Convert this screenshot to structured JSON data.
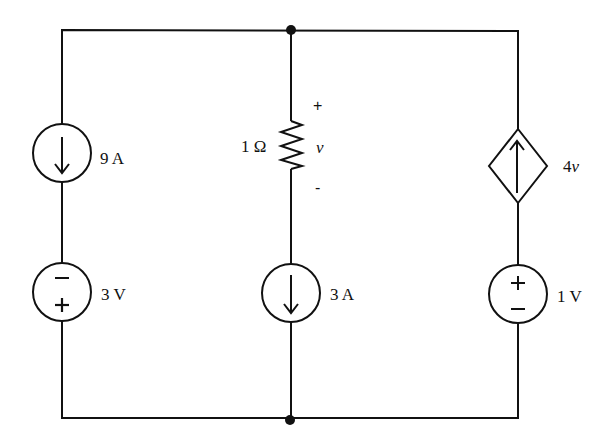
{
  "diagram": {
    "type": "circuit",
    "nodes": [
      "top",
      "bottom"
    ],
    "branches": [
      {
        "position": "left",
        "elements": [
          {
            "type": "current-source",
            "label": "9 A",
            "direction": "down"
          },
          {
            "type": "voltage-source",
            "label": "3 V",
            "top_sign": "−",
            "bottom_sign": "+"
          }
        ]
      },
      {
        "position": "middle",
        "elements": [
          {
            "type": "resistor",
            "label": "1 Ω",
            "voltage_label": "v",
            "plus": "+",
            "minus": "-"
          },
          {
            "type": "current-source",
            "label": "3 A",
            "direction": "down"
          }
        ]
      },
      {
        "position": "right",
        "elements": [
          {
            "type": "dependent-current-source",
            "label": "4v",
            "direction": "up"
          },
          {
            "type": "voltage-source",
            "label": "1 V",
            "top_sign": "+",
            "bottom_sign": "−"
          }
        ]
      }
    ]
  },
  "labels": {
    "src_9a": "9 A",
    "src_3v": "3 V",
    "res_1ohm": "1 Ω",
    "res_v": "v",
    "res_plus": "+",
    "res_minus": "-",
    "src_3a": "3 A",
    "dep_4v_num": "4",
    "dep_4v_var": "v",
    "src_1v": "1 V",
    "sign_3v_top": "−",
    "sign_3v_bottom": "+",
    "sign_1v_top": "+",
    "sign_1v_bottom": "−"
  }
}
